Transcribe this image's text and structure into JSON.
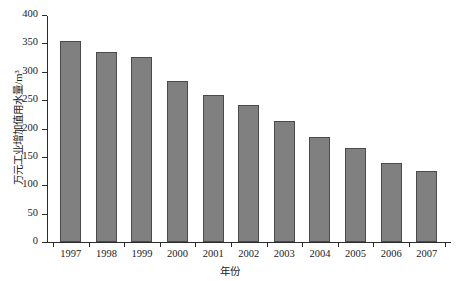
{
  "chart_data": {
    "type": "bar",
    "title": "",
    "subtitle": "",
    "xlabel": "年份",
    "ylabel": "万元工业增加值用水量/m³",
    "categories": [
      "1997",
      "1998",
      "1999",
      "2000",
      "2001",
      "2002",
      "2003",
      "2004",
      "2005",
      "2006",
      "2007"
    ],
    "values": [
      354,
      335,
      326,
      284,
      259,
      241,
      213,
      185,
      166,
      139,
      125
    ],
    "series": [
      {
        "name": "万元工业增加值用水量",
        "values": [
          354,
          335,
          326,
          284,
          259,
          241,
          213,
          185,
          166,
          139,
          125
        ]
      }
    ],
    "ylim": [
      0,
      400
    ],
    "y_ticks": [
      0,
      50,
      100,
      150,
      200,
      250,
      300,
      350,
      400
    ],
    "y_tick_labels": [
      "0",
      "50",
      "100",
      "150",
      "200",
      "250",
      "300",
      "350",
      "400"
    ],
    "grid": false,
    "legend": false,
    "legend_position": "none",
    "annotations": [],
    "colors": {
      "bar_fill": "#808080",
      "bar_border": "#4a4a4a",
      "axis": "#2b2b2b",
      "text": "#1a1a1a",
      "background": "#ffffff"
    }
  }
}
